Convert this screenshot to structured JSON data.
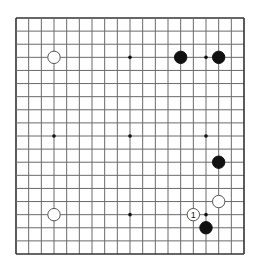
{
  "board": {
    "size": 19,
    "origin_x": 16,
    "origin_y": 18,
    "end_x": 244,
    "end_y": 254,
    "line_color": "#6a6a6a",
    "border_color": "#333333",
    "star_points": [
      [
        3,
        3
      ],
      [
        9,
        3
      ],
      [
        15,
        3
      ],
      [
        3,
        9
      ],
      [
        9,
        9
      ],
      [
        15,
        9
      ],
      [
        3,
        15
      ],
      [
        9,
        15
      ],
      [
        15,
        15
      ]
    ],
    "stones": [
      {
        "color": "white",
        "col": 3,
        "row": 3,
        "label": ""
      },
      {
        "color": "black",
        "col": 13,
        "row": 3,
        "label": ""
      },
      {
        "color": "black",
        "col": 16,
        "row": 3,
        "label": ""
      },
      {
        "color": "black",
        "col": 16,
        "row": 11,
        "label": ""
      },
      {
        "color": "white",
        "col": 16,
        "row": 14,
        "label": ""
      },
      {
        "color": "white",
        "col": 3,
        "row": 15,
        "label": ""
      },
      {
        "color": "white",
        "col": 14,
        "row": 15,
        "label": "1"
      },
      {
        "color": "black",
        "col": 15,
        "row": 16,
        "label": ""
      }
    ]
  }
}
